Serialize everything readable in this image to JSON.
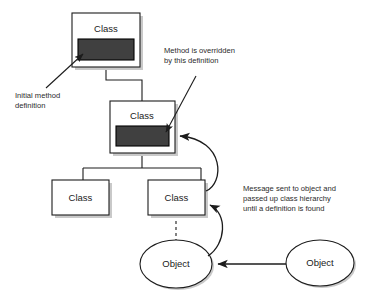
{
  "diagram": {
    "background_color": "#ffffff",
    "method_bar_color": "#404040",
    "shadow_color": "#c9c9c9",
    "stroke_color": "#1c1c1c",
    "nodes": {
      "top_class": {
        "label": "Class",
        "has_method_bar": true
      },
      "middle_class": {
        "label": "Class",
        "has_method_bar": true
      },
      "leaf_left_class": {
        "label": "Class",
        "has_method_bar": false
      },
      "leaf_right_class": {
        "label": "Class",
        "has_method_bar": false
      },
      "left_object": {
        "label": "Object"
      },
      "right_object": {
        "label": "Object"
      }
    },
    "annotations": {
      "initial_method": {
        "line1": "Initial method",
        "line2": "definition"
      },
      "overridden_method": {
        "line1": "Method is overridden",
        "line2": "by this definition"
      },
      "message_passing": {
        "line1": "Message sent to object and",
        "line2": "passed up class hierarchy",
        "line3": "until a definition is found"
      }
    }
  }
}
